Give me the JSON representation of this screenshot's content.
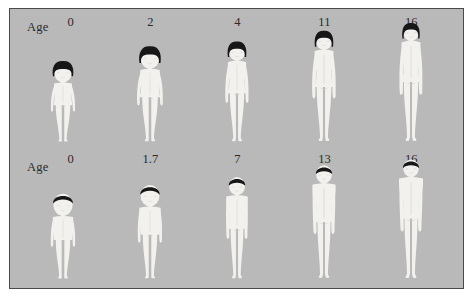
{
  "plate": {
    "background_color": "#b9b9b9",
    "border_color": "#4a4a4a",
    "page_color": "#ffffff",
    "skin_color": "#f2f1ee",
    "hair_color": "#171717"
  },
  "rows": [
    {
      "name": "female-growth-series",
      "label": "Age",
      "sex": "female",
      "hair_style": "bob",
      "figures": [
        {
          "age_label": "0",
          "age": 0,
          "height_px": 83,
          "head_ratio": 0.26,
          "cx_pct": 11.8
        },
        {
          "age_label": "2",
          "age": 2,
          "height_px": 98,
          "head_ratio": 0.23,
          "cx_pct": 31.0
        },
        {
          "age_label": "4",
          "age": 4,
          "height_px": 103,
          "head_ratio": 0.19,
          "cx_pct": 50.2
        },
        {
          "age_label": "11",
          "age": 11,
          "height_px": 114,
          "head_ratio": 0.17,
          "cx_pct": 69.4
        },
        {
          "age_label": "16",
          "age": 16,
          "height_px": 122,
          "head_ratio": 0.15,
          "cx_pct": 88.6
        }
      ]
    },
    {
      "name": "male-growth-series",
      "label": "Age",
      "sex": "male",
      "hair_style": "short",
      "figures": [
        {
          "age_label": "0",
          "age": 0,
          "height_px": 88,
          "head_ratio": 0.26,
          "cx_pct": 11.8
        },
        {
          "age_label": "1.7",
          "age": 1.7,
          "height_px": 97,
          "head_ratio": 0.23,
          "cx_pct": 31.0
        },
        {
          "age_label": "7",
          "age": 7,
          "height_px": 105,
          "head_ratio": 0.18,
          "cx_pct": 50.2
        },
        {
          "age_label": "13",
          "age": 13,
          "height_px": 117,
          "head_ratio": 0.16,
          "cx_pct": 69.4
        },
        {
          "age_label": "16",
          "age": 16,
          "height_px": 123,
          "head_ratio": 0.15,
          "cx_pct": 88.6
        }
      ]
    }
  ]
}
